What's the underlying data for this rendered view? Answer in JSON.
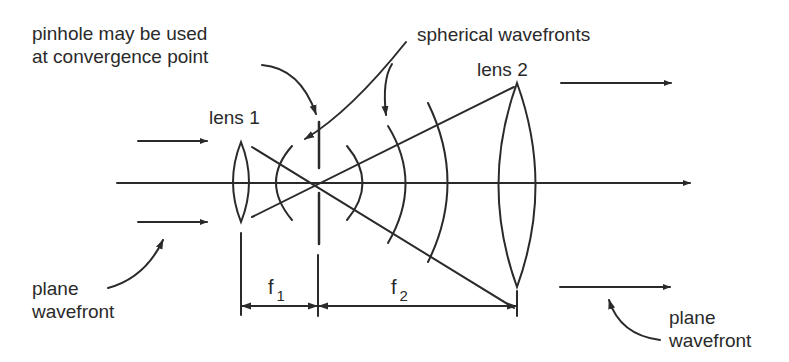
{
  "diagram": {
    "labels": {
      "pinhole_line1": "pinhole may be used",
      "pinhole_line2": "at convergence point",
      "spherical_wavefronts": "spherical wavefronts",
      "lens1": "lens 1",
      "lens2": "lens 2",
      "plane_wavefront_left_line1": "plane",
      "plane_wavefront_left_line2": "wavefront",
      "plane_wavefront_right_line1": "plane",
      "plane_wavefront_right_line2": "wavefront",
      "f1_symbol": "f",
      "f1_subscript": "1",
      "f2_symbol": "f",
      "f2_subscript": "2"
    },
    "components": [
      {
        "name": "lens 1",
        "type": "biconvex lens",
        "x": 241,
        "y_top": 142,
        "y_bottom": 222
      },
      {
        "name": "pinhole",
        "type": "aperture (dashed line)",
        "x": 318
      },
      {
        "name": "lens 2",
        "type": "biconvex lens",
        "x": 517,
        "y_top": 83,
        "y_bottom": 287
      }
    ],
    "distances": [
      {
        "label": "f1",
        "from": "lens 1",
        "to": "convergence point"
      },
      {
        "label": "f2",
        "from": "convergence point",
        "to": "lens 2"
      }
    ],
    "colors": {
      "ink": "#2a2a2a",
      "background": "#ffffff"
    }
  }
}
